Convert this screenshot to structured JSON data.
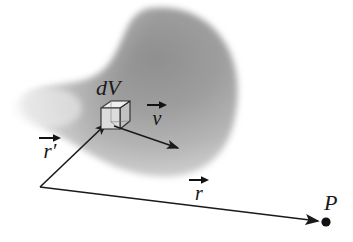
{
  "figure": {
    "background_color": "#ffffff",
    "ink_color": "#1a1a1a"
  },
  "blob": {
    "name": "source-region",
    "fill_light": "#f2f2f2",
    "fill_mid": "#b4b4b4",
    "fill_dark": "#8a8a8a",
    "edge_softness_px": 7
  },
  "cube": {
    "label": "dV",
    "face_front": "#d9d9d9",
    "face_top": "#efefef",
    "face_side": "#bdbdbd",
    "stroke": "#2b2b2b"
  },
  "vectors": [
    {
      "id": "r-prime",
      "symbol": "r",
      "prime": "′",
      "label": "r′",
      "description": "source-point position vector",
      "from": [
        40,
        187
      ],
      "to": [
        108,
        122
      ],
      "color": "#1a1a1a"
    },
    {
      "id": "v",
      "symbol": "v",
      "prime": "",
      "label": "v",
      "description": "velocity of charge in volume element",
      "from": [
        116,
        127
      ],
      "to": [
        181,
        149
      ],
      "color": "#1a1a1a"
    },
    {
      "id": "r",
      "symbol": "r",
      "prime": "",
      "label": "r",
      "description": "field-point position vector",
      "from": [
        40,
        187
      ],
      "to": [
        322,
        221
      ],
      "color": "#1a1a1a"
    }
  ],
  "points": [
    {
      "id": "P",
      "label": "P",
      "description": "field point",
      "position": [
        326,
        222
      ],
      "color": "#111111",
      "radius": 4.6
    }
  ],
  "labels": {
    "volume_element": "dV",
    "field_point": "P",
    "source_vector": "r′",
    "velocity_vector": "v",
    "field_vector": "r"
  }
}
